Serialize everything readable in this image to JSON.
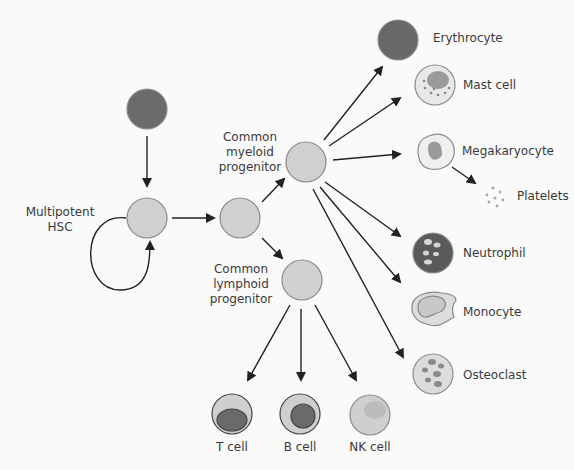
{
  "diagram": {
    "labels": {
      "hsc": [
        "Multipotent",
        "HSC"
      ],
      "cmp": [
        "Common",
        "myeloid",
        "progenitor"
      ],
      "clp": [
        "Common",
        "lymphoid",
        "progenitor"
      ],
      "erythrocyte": "Erythrocyte",
      "mast": "Mast cell",
      "megakaryocyte": "Megakaryocyte",
      "platelets": "Platelets",
      "neutrophil": "Neutrophil",
      "monocyte": "Monocyte",
      "osteoclast": "Osteoclast",
      "tcell": "T cell",
      "bcell": "B cell",
      "nkcell": "NK cell"
    },
    "colors": {
      "progenitor_fill": "#cfcfcf",
      "dark_fill": "#6a6a6a",
      "stroke": "#7a7a7a",
      "arrow": "#222222",
      "text": "#3a3a3a"
    }
  }
}
